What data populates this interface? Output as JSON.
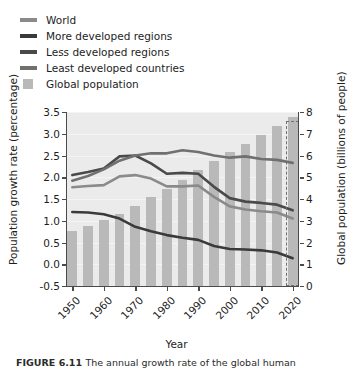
{
  "legend": {
    "position": "above-plot",
    "items": [
      {
        "label": "World",
        "type": "line",
        "color": "#8a8a8a"
      },
      {
        "label": "More developed regions",
        "type": "line",
        "color": "#3a3a3a"
      },
      {
        "label": "Less developed regions",
        "type": "line",
        "color": "#4a4a4a"
      },
      {
        "label": "Least developed countries",
        "type": "line",
        "color": "#707070"
      },
      {
        "label": "Global population",
        "type": "block",
        "color": "#b9b9b9"
      }
    ]
  },
  "caption": {
    "figure_number": "FIGURE 6.11",
    "text": "The annual growth rate of the global human"
  },
  "chart_data": {
    "type": "line",
    "title": "",
    "xlabel": "Year",
    "ylabel": "Population growth rate (percentage)",
    "y2label": "Global population (billions of people)",
    "grid": true,
    "xlim": [
      1948,
      2022
    ],
    "ylim": [
      -0.5,
      3.5
    ],
    "y2lim": [
      0,
      8
    ],
    "xticks": [
      1950,
      1960,
      1970,
      1980,
      1990,
      2000,
      2010,
      2020
    ],
    "yticks": [
      -0.5,
      0.0,
      0.5,
      1.0,
      1.5,
      2.0,
      2.5,
      3.0,
      3.5
    ],
    "y2ticks": [
      0,
      1,
      2,
      3,
      4,
      5,
      6,
      7,
      8
    ],
    "x": [
      1950,
      1955,
      1960,
      1965,
      1970,
      1975,
      1980,
      1985,
      1990,
      1995,
      2000,
      2005,
      2010,
      2015,
      2020
    ],
    "series": [
      {
        "name": "World",
        "color": "#8a8a8a",
        "axis": "left",
        "values": [
          1.77,
          1.8,
          1.82,
          2.02,
          2.05,
          1.97,
          1.79,
          1.79,
          1.81,
          1.55,
          1.33,
          1.26,
          1.22,
          1.19,
          1.05
        ]
      },
      {
        "name": "More developed regions",
        "color": "#3a3a3a",
        "axis": "left",
        "values": [
          1.2,
          1.19,
          1.15,
          1.05,
          0.86,
          0.76,
          0.67,
          0.61,
          0.56,
          0.42,
          0.35,
          0.34,
          0.32,
          0.27,
          0.14
        ]
      },
      {
        "name": "Less developed regions",
        "color": "#4a4a4a",
        "axis": "left",
        "values": [
          2.05,
          2.12,
          2.2,
          2.48,
          2.5,
          2.32,
          2.08,
          2.1,
          2.08,
          1.78,
          1.52,
          1.44,
          1.41,
          1.37,
          1.24
        ]
      },
      {
        "name": "Least developed countries",
        "color": "#707070",
        "axis": "left",
        "values": [
          1.92,
          2.03,
          2.18,
          2.38,
          2.5,
          2.55,
          2.55,
          2.62,
          2.58,
          2.5,
          2.45,
          2.48,
          2.42,
          2.4,
          2.33
        ]
      }
    ],
    "bars": {
      "name": "Global population",
      "color": "#b9b9b9",
      "axis": "right",
      "unit": "billions of people",
      "values": [
        2.54,
        2.77,
        3.03,
        3.33,
        3.7,
        4.07,
        4.46,
        4.87,
        5.33,
        5.74,
        6.14,
        6.54,
        6.96,
        7.38,
        7.79
      ]
    },
    "annotations": [
      {
        "name": "projection-box",
        "type": "dashed-rect",
        "x_range": [
          2018,
          2022
        ],
        "y2_range": [
          0,
          7.6
        ]
      }
    ]
  }
}
